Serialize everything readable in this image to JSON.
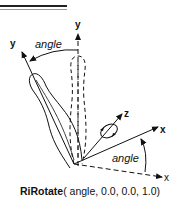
{
  "figure": {
    "labels": {
      "y_original": "y",
      "y_rotated": "y",
      "z_axis": "z",
      "x_rotated": "x",
      "x_original": "x",
      "angle_top": "angle",
      "angle_bottom": "angle"
    },
    "caption": {
      "function_name": "RiRotate",
      "arguments": "( angle, 0.0, 0.0, 1.0)"
    },
    "colors": {
      "ink": "#111111",
      "rule_dark": "#222222",
      "rule_light": "#999999"
    }
  }
}
